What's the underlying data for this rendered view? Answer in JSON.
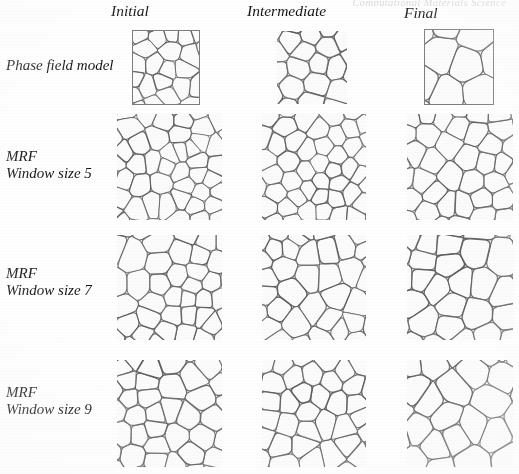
{
  "figure": {
    "cut_off_running_head": "Computational Materials Science",
    "columns": [
      {
        "label": "Initial"
      },
      {
        "label": "Intermediate"
      },
      {
        "label": "Final"
      }
    ],
    "rows": [
      {
        "label_line1": "Phase field model",
        "label_line2": ""
      },
      {
        "label_line1": "MRF",
        "label_line2": "Window size 5"
      },
      {
        "label_line1": "MRF",
        "label_line2": "Window size 7"
      },
      {
        "label_line1": "MRF",
        "label_line2": "Window size 9"
      }
    ],
    "panels": [
      {
        "row": "Phase field model",
        "column": "Initial",
        "content": "grain-structure-micrograph",
        "framed": true,
        "grain_density": "very-fine",
        "seed": 11
      },
      {
        "row": "Phase field model",
        "column": "Intermediate",
        "content": "grain-structure-micrograph",
        "framed": false,
        "grain_density": "fine",
        "seed": 12
      },
      {
        "row": "Phase field model",
        "column": "Final",
        "content": "grain-structure-micrograph",
        "framed": true,
        "grain_density": "coarse",
        "seed": 13
      },
      {
        "row": "MRF Window size 5",
        "column": "Initial",
        "content": "grain-structure-micrograph",
        "framed": false,
        "grain_density": "very-fine",
        "seed": 21
      },
      {
        "row": "MRF Window size 5",
        "column": "Intermediate",
        "content": "grain-structure-micrograph",
        "framed": false,
        "grain_density": "very-fine",
        "seed": 22
      },
      {
        "row": "MRF Window size 5",
        "column": "Final",
        "content": "grain-structure-micrograph",
        "framed": false,
        "grain_density": "fine",
        "seed": 23
      },
      {
        "row": "MRF Window size 7",
        "column": "Initial",
        "content": "grain-structure-micrograph",
        "framed": false,
        "grain_density": "fine",
        "seed": 31
      },
      {
        "row": "MRF Window size 7",
        "column": "Intermediate",
        "content": "grain-structure-micrograph",
        "framed": false,
        "grain_density": "fine",
        "seed": 32
      },
      {
        "row": "MRF Window size 7",
        "column": "Final",
        "content": "grain-structure-micrograph",
        "framed": false,
        "grain_density": "medium",
        "seed": 33
      },
      {
        "row": "MRF Window size 9",
        "column": "Initial",
        "content": "grain-structure-micrograph",
        "framed": false,
        "grain_density": "fine",
        "seed": 41
      },
      {
        "row": "MRF Window size 9",
        "column": "Intermediate",
        "content": "grain-structure-micrograph",
        "framed": false,
        "grain_density": "fine",
        "seed": 42
      },
      {
        "row": "MRF Window size 9",
        "column": "Final",
        "content": "grain-structure-micrograph",
        "framed": false,
        "grain_density": "medium",
        "seed": 43
      }
    ],
    "colors": {
      "background": "#fefefe",
      "grain_boundary": "#5c5c5c",
      "grain_interior": "#fbfbfb",
      "text": "#151515",
      "panel_frame": "#7d7d7d"
    }
  }
}
